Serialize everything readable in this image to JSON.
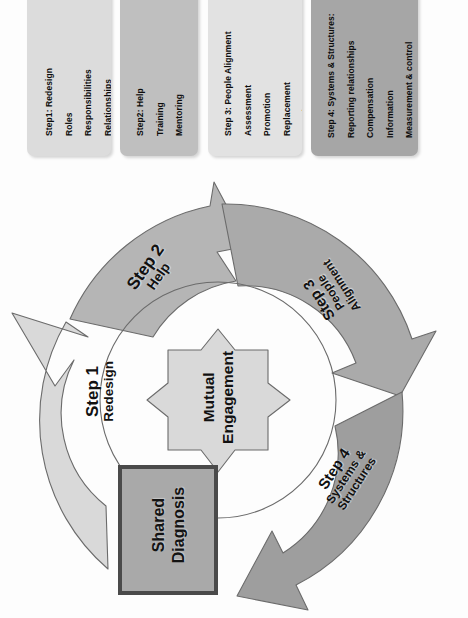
{
  "diagram": {
    "type": "cycle-diagram",
    "center": {
      "label": "Mutual\nEngagement",
      "line1": "Mutual",
      "line2": "Engagement"
    },
    "anchor_box": {
      "line1": "Shared",
      "line2": "Diagnosis",
      "fill": "#a9a9a9",
      "border": "#4a4a4a"
    },
    "steps": [
      {
        "number": "Step 1",
        "name": "Redesign",
        "name_line1": "Redesign",
        "name_line2": "",
        "fill": "#d9d9d9"
      },
      {
        "number": "Step 2",
        "name": "Help",
        "name_line1": "Help",
        "name_line2": "",
        "fill": "#b5b5b5"
      },
      {
        "number": "Step 3",
        "name": "People Alignment",
        "name_line1": "People",
        "name_line2": "Alignment",
        "fill": "#aaaaaa"
      },
      {
        "number": "Step 4",
        "name": "Systems & Structures",
        "name_line1": "Systems &",
        "name_line2": "Structures",
        "fill": "#9e9e9e"
      }
    ]
  },
  "detail_boxes": [
    {
      "title": "Step1: Redesign",
      "items": [
        "Roles",
        "Responsibilities",
        "Relationships"
      ],
      "fill": "#dcdcdc"
    },
    {
      "title": "Step2: Help",
      "items": [
        "Training",
        "Mentoring"
      ],
      "fill": "#bfbfbf"
    },
    {
      "title": "Step 3: People Alignment",
      "items": [
        "Assessment",
        "Promotion",
        "Replacement",
        "Recruitment"
      ],
      "fill": "#e2e2e2"
    },
    {
      "title": "Step 4: Systems & Structures:",
      "items": [
        "Reporting relationships",
        "Compensation",
        "Information",
        "Measurement & control"
      ],
      "fill": "#a6a6a6"
    }
  ],
  "colors": {
    "outline": "#6b6b6b",
    "text": "#111111",
    "background": "#fdfdfd"
  }
}
